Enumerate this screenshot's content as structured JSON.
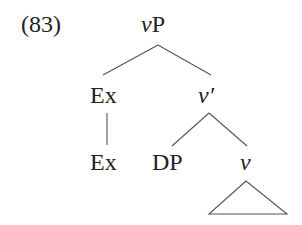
{
  "example": {
    "number": "(83)"
  },
  "tree": {
    "root": {
      "cat": "v",
      "suffix": "P"
    },
    "ex_spec": {
      "label": "Ex"
    },
    "vbar": {
      "cat": "v",
      "suffix": "′"
    },
    "ex_leaf": {
      "label": "Ex"
    },
    "dp": {
      "label": "DP"
    },
    "v_head": {
      "cat": "v"
    },
    "triangle": "v-subtree-triangle"
  },
  "colors": {
    "line": "#555555",
    "text": "#222222"
  }
}
